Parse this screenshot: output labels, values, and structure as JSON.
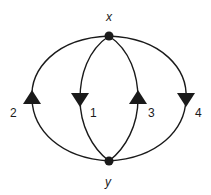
{
  "diagram": {
    "type": "multigraph",
    "colors": {
      "stroke": "#1a1a1a",
      "background": "#ffffff"
    },
    "nodes": [
      {
        "id": "x",
        "label": "x",
        "cx": 109,
        "cy": 36
      },
      {
        "id": "y",
        "label": "y",
        "cx": 109,
        "cy": 161
      }
    ],
    "edges": [
      {
        "id": "2",
        "label": "2",
        "from": "y",
        "to": "x",
        "arrow": "up",
        "arrow_pos": [
          32,
          99
        ]
      },
      {
        "id": "1",
        "label": "1",
        "from": "x",
        "to": "y",
        "arrow": "down",
        "arrow_pos": [
          80,
          98
        ]
      },
      {
        "id": "3",
        "label": "3",
        "from": "y",
        "to": "x",
        "arrow": "up",
        "arrow_pos": [
          138,
          99
        ]
      },
      {
        "id": "4",
        "label": "4",
        "from": "x",
        "to": "y",
        "arrow": "down",
        "arrow_pos": [
          186,
          98
        ]
      }
    ]
  }
}
